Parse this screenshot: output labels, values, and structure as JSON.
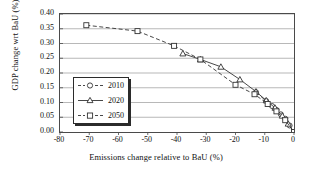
{
  "chart_data": {
    "type": "line",
    "title": "",
    "xlabel": "Emissions change relative to BaU (%)",
    "ylabel": "GDP change wrt BaU (%)",
    "xlim": [
      -80,
      0
    ],
    "ylim": [
      0.0,
      0.4
    ],
    "xticks": [
      "-80",
      "-70",
      "-60",
      "-50",
      "-40",
      "-30",
      "-20",
      "-10",
      "0"
    ],
    "xtick_values": [
      -80,
      -70,
      -60,
      -50,
      -40,
      -30,
      -20,
      -10,
      0
    ],
    "yticks": [
      "0.00",
      "0.05",
      "0.10",
      "0.15",
      "0.20",
      "0.25",
      "0.30",
      "0.35",
      "0.40"
    ],
    "ytick_values": [
      0.0,
      0.05,
      0.1,
      0.15,
      0.2,
      0.25,
      0.3,
      0.35,
      0.4
    ],
    "grid": "horizontal",
    "legend_position": "center-left",
    "line_style": "dashed",
    "series": [
      {
        "name": "2010",
        "marker": "circle",
        "points": [
          {
            "x": -13.0,
            "y": 0.135
          },
          {
            "x": -9.5,
            "y": 0.105
          },
          {
            "x": -7.5,
            "y": 0.088
          },
          {
            "x": -6.0,
            "y": 0.075
          },
          {
            "x": -4.5,
            "y": 0.06
          },
          {
            "x": -3.0,
            "y": 0.045
          },
          {
            "x": -1.5,
            "y": 0.022
          },
          {
            "x": 0.0,
            "y": 0.0
          }
        ]
      },
      {
        "name": "2020",
        "marker": "triangle",
        "points": [
          {
            "x": -38.0,
            "y": 0.266
          },
          {
            "x": -32.0,
            "y": 0.246
          },
          {
            "x": -25.0,
            "y": 0.221
          },
          {
            "x": -18.5,
            "y": 0.178
          },
          {
            "x": -13.0,
            "y": 0.137
          },
          {
            "x": -9.5,
            "y": 0.107
          },
          {
            "x": -6.5,
            "y": 0.082
          },
          {
            "x": -4.0,
            "y": 0.055
          },
          {
            "x": -2.0,
            "y": 0.028
          },
          {
            "x": 0.0,
            "y": 0.0
          }
        ]
      },
      {
        "name": "2050",
        "marker": "square",
        "points": [
          {
            "x": -71.0,
            "y": 0.362
          },
          {
            "x": -53.5,
            "y": 0.342
          },
          {
            "x": -41.0,
            "y": 0.292
          },
          {
            "x": -32.0,
            "y": 0.246
          },
          {
            "x": -20.0,
            "y": 0.16
          },
          {
            "x": -13.5,
            "y": 0.128
          },
          {
            "x": -9.0,
            "y": 0.095
          },
          {
            "x": -6.0,
            "y": 0.07
          },
          {
            "x": -3.0,
            "y": 0.04
          },
          {
            "x": 0.0,
            "y": 0.0
          }
        ]
      }
    ]
  },
  "legend": {
    "items": [
      {
        "label": "2010"
      },
      {
        "label": "2020"
      },
      {
        "label": "2050"
      }
    ]
  }
}
